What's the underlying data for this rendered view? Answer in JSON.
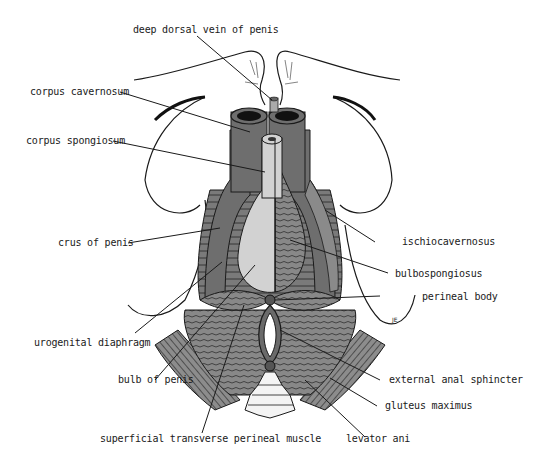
{
  "figure": {
    "type": "anatomical-illustration",
    "colors": {
      "background": "#ffffff",
      "muscle_dark": "#6e6e6e",
      "muscle_mid": "#8a8a8a",
      "corpus_light": "#d2d2d2",
      "outline": "#1a1a1a"
    },
    "signature": "JE"
  },
  "labels": [
    {
      "id": "deep-dorsal-vein",
      "text": "deep dorsal vein of penis"
    },
    {
      "id": "corpus-cavernosum",
      "text": "corpus cavernosum"
    },
    {
      "id": "corpus-spongiosum",
      "text": "corpus spongiosum"
    },
    {
      "id": "crus-of-penis",
      "text": "crus of penis"
    },
    {
      "id": "ischiocavernosus",
      "text": "ischiocavernosus"
    },
    {
      "id": "bulbospongiosus",
      "text": "bulbospongiosus"
    },
    {
      "id": "perineal-body",
      "text": "perineal body"
    },
    {
      "id": "urogenital-diaphragm",
      "text": "urogenital diaphragm"
    },
    {
      "id": "bulb-of-penis",
      "text": "bulb of penis"
    },
    {
      "id": "external-anal-sphincter",
      "text": "external anal sphincter"
    },
    {
      "id": "gluteus-maximus",
      "text": "gluteus maximus"
    },
    {
      "id": "superficial-transverse-perineal-muscle",
      "text": "superficial transverse perineal muscle"
    },
    {
      "id": "levator-ani",
      "text": "levator ani"
    }
  ]
}
